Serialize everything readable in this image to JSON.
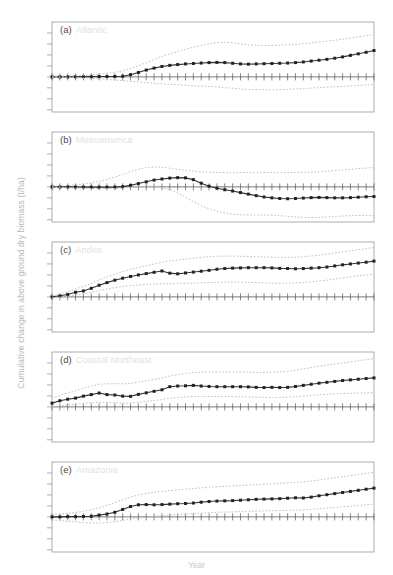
{
  "figure": {
    "ylabel": "Cumulative change in above ground dry biomass (t/ha)",
    "xlabel": "Year",
    "colors": {
      "line": "#333333",
      "marker": "#222222",
      "band": "#c0c0c8",
      "frame": "#9a9a9a",
      "zero_line": "#555555",
      "title_faint": "#e2e2e2",
      "axis_label": "#c2c2c2"
    }
  },
  "chart_data": [
    {
      "type": "line",
      "id": "a",
      "panel_label": "(a)",
      "title": "Atlantic",
      "xlabel": "",
      "ylabel": "",
      "xlim": [
        0,
        41
      ],
      "ylim": [
        -3.2,
        5.0
      ],
      "grid": false,
      "legend": "none",
      "x": [
        0,
        1,
        2,
        3,
        4,
        5,
        6,
        7,
        8,
        9,
        10,
        11,
        12,
        13,
        14,
        15,
        16,
        17,
        18,
        19,
        20,
        21,
        22,
        23,
        24,
        25,
        26,
        27,
        28,
        29,
        30,
        31,
        32,
        33,
        34,
        35,
        36,
        37,
        38,
        39,
        40,
        41
      ],
      "series": [
        {
          "name": "mean",
          "style": "solid-marker",
          "values": [
            0.0,
            0.0,
            0.0,
            0.01,
            0.02,
            0.02,
            0.03,
            0.03,
            0.04,
            0.06,
            0.2,
            0.4,
            0.62,
            0.8,
            0.95,
            1.05,
            1.12,
            1.18,
            1.22,
            1.26,
            1.3,
            1.32,
            1.3,
            1.24,
            1.18,
            1.16,
            1.18,
            1.2,
            1.22,
            1.24,
            1.26,
            1.3,
            1.36,
            1.44,
            1.52,
            1.6,
            1.7,
            1.82,
            1.96,
            2.1,
            2.24,
            2.4
          ]
        },
        {
          "name": "upper",
          "style": "dotted",
          "values": [
            0.05,
            0.06,
            0.08,
            0.1,
            0.14,
            0.18,
            0.24,
            0.32,
            0.42,
            0.56,
            0.78,
            1.02,
            1.3,
            1.58,
            1.86,
            2.1,
            2.32,
            2.52,
            2.7,
            2.86,
            3.0,
            3.12,
            3.16,
            3.1,
            3.0,
            2.92,
            2.88,
            2.86,
            2.86,
            2.88,
            2.92,
            2.96,
            3.02,
            3.1,
            3.18,
            3.26,
            3.34,
            3.44,
            3.54,
            3.64,
            3.74,
            3.86
          ]
        },
        {
          "name": "lower",
          "style": "dotted",
          "values": [
            -0.04,
            -0.05,
            -0.06,
            -0.08,
            -0.1,
            -0.13,
            -0.17,
            -0.22,
            -0.28,
            -0.34,
            -0.4,
            -0.46,
            -0.52,
            -0.58,
            -0.63,
            -0.68,
            -0.72,
            -0.76,
            -0.8,
            -0.84,
            -0.88,
            -0.92,
            -0.98,
            -1.04,
            -1.1,
            -1.14,
            -1.16,
            -1.18,
            -1.18,
            -1.16,
            -1.14,
            -1.1,
            -1.06,
            -1.02,
            -0.98,
            -0.94,
            -0.9,
            -0.86,
            -0.82,
            -0.78,
            -0.74,
            -0.7
          ]
        }
      ]
    },
    {
      "type": "line",
      "id": "b",
      "panel_label": "(b)",
      "title": "Mesoamerica",
      "xlabel": "",
      "ylabel": "",
      "xlim": [
        0,
        41
      ],
      "ylim": [
        -3.2,
        5.0
      ],
      "grid": false,
      "legend": "none",
      "x": [
        0,
        1,
        2,
        3,
        4,
        5,
        6,
        7,
        8,
        9,
        10,
        11,
        12,
        13,
        14,
        15,
        16,
        17,
        18,
        19,
        20,
        21,
        22,
        23,
        24,
        25,
        26,
        27,
        28,
        29,
        30,
        31,
        32,
        33,
        34,
        35,
        36,
        37,
        38,
        39,
        40,
        41
      ],
      "series": [
        {
          "name": "mean",
          "style": "solid-marker",
          "values": [
            0.0,
            0.0,
            0.0,
            -0.01,
            -0.02,
            -0.02,
            -0.03,
            -0.03,
            -0.02,
            0.02,
            0.14,
            0.3,
            0.46,
            0.62,
            0.72,
            0.8,
            0.84,
            0.82,
            0.66,
            0.34,
            0.06,
            -0.12,
            -0.26,
            -0.38,
            -0.52,
            -0.66,
            -0.8,
            -0.92,
            -1.0,
            -1.06,
            -1.08,
            -1.06,
            -1.02,
            -0.98,
            -0.96,
            -0.98,
            -1.0,
            -1.0,
            -0.98,
            -0.94,
            -0.9,
            -0.88
          ]
        },
        {
          "name": "upper",
          "style": "dotted",
          "values": [
            0.06,
            0.08,
            0.12,
            0.18,
            0.26,
            0.36,
            0.5,
            0.68,
            0.9,
            1.14,
            1.4,
            1.62,
            1.76,
            1.82,
            1.78,
            1.7,
            1.6,
            1.52,
            1.44,
            1.38,
            1.34,
            1.32,
            1.3,
            1.3,
            1.3,
            1.3,
            1.3,
            1.3,
            1.3,
            1.3,
            1.3,
            1.3,
            1.32,
            1.34,
            1.38,
            1.42,
            1.48,
            1.54,
            1.6,
            1.66,
            1.72,
            1.76
          ]
        },
        {
          "name": "lower",
          "style": "dotted",
          "values": [
            -0.05,
            -0.06,
            -0.08,
            -0.1,
            -0.12,
            -0.14,
            -0.16,
            -0.16,
            -0.14,
            -0.1,
            -0.04,
            0.02,
            0.06,
            0.04,
            -0.06,
            -0.26,
            -0.56,
            -0.94,
            -1.34,
            -1.7,
            -2.0,
            -2.22,
            -2.38,
            -2.48,
            -2.54,
            -2.56,
            -2.56,
            -2.56,
            -2.58,
            -2.62,
            -2.68,
            -2.74,
            -2.78,
            -2.8,
            -2.78,
            -2.74,
            -2.7,
            -2.66,
            -2.62,
            -2.6,
            -2.6,
            -2.62
          ]
        }
      ]
    },
    {
      "type": "line",
      "id": "c",
      "panel_label": "(c)",
      "title": "Andes",
      "xlabel": "",
      "ylabel": "",
      "xlim": [
        0,
        41
      ],
      "ylim": [
        -3.2,
        5.0
      ],
      "grid": false,
      "legend": "none",
      "x": [
        0,
        1,
        2,
        3,
        4,
        5,
        6,
        7,
        8,
        9,
        10,
        11,
        12,
        13,
        14,
        15,
        16,
        17,
        18,
        19,
        20,
        21,
        22,
        23,
        24,
        25,
        26,
        27,
        28,
        29,
        30,
        31,
        32,
        33,
        34,
        35,
        36,
        37,
        38,
        39,
        40,
        41
      ],
      "series": [
        {
          "name": "mean",
          "style": "solid-marker",
          "values": [
            0.0,
            0.1,
            0.22,
            0.42,
            0.54,
            0.78,
            1.06,
            1.3,
            1.52,
            1.7,
            1.86,
            2.0,
            2.12,
            2.24,
            2.36,
            2.16,
            2.1,
            2.18,
            2.26,
            2.34,
            2.42,
            2.52,
            2.58,
            2.62,
            2.64,
            2.66,
            2.66,
            2.66,
            2.64,
            2.6,
            2.58,
            2.56,
            2.58,
            2.62,
            2.66,
            2.72,
            2.82,
            2.92,
            3.0,
            3.08,
            3.16,
            3.26
          ]
        },
        {
          "name": "upper",
          "style": "dotted",
          "values": [
            0.1,
            0.26,
            0.46,
            0.72,
            0.94,
            1.22,
            1.54,
            1.82,
            2.08,
            2.3,
            2.5,
            2.68,
            2.84,
            3.0,
            3.16,
            3.28,
            3.36,
            3.44,
            3.52,
            3.6,
            3.66,
            3.7,
            3.72,
            3.72,
            3.7,
            3.68,
            3.66,
            3.64,
            3.62,
            3.6,
            3.6,
            3.62,
            3.66,
            3.72,
            3.8,
            3.9,
            4.0,
            4.1,
            4.2,
            4.3,
            4.4,
            4.5
          ]
        },
        {
          "name": "lower",
          "style": "dotted",
          "values": [
            -0.06,
            -0.02,
            0.06,
            0.18,
            0.28,
            0.42,
            0.58,
            0.72,
            0.84,
            0.94,
            1.02,
            1.08,
            1.12,
            1.16,
            1.18,
            1.2,
            1.22,
            1.24,
            1.26,
            1.28,
            1.3,
            1.32,
            1.34,
            1.34,
            1.34,
            1.32,
            1.3,
            1.28,
            1.26,
            1.24,
            1.24,
            1.26,
            1.3,
            1.36,
            1.44,
            1.52,
            1.62,
            1.72,
            1.82,
            1.92,
            2.0,
            2.08
          ]
        }
      ]
    },
    {
      "type": "line",
      "id": "d",
      "panel_label": "(d)",
      "title": "Coastal Northeast",
      "xlabel": "",
      "ylabel": "",
      "xlim": [
        0,
        41
      ],
      "ylim": [
        -3.2,
        5.0
      ],
      "grid": false,
      "legend": "none",
      "x": [
        0,
        1,
        2,
        3,
        4,
        5,
        6,
        7,
        8,
        9,
        10,
        11,
        12,
        13,
        14,
        15,
        16,
        17,
        18,
        19,
        20,
        21,
        22,
        23,
        24,
        25,
        26,
        27,
        28,
        29,
        30,
        31,
        32,
        33,
        34,
        35,
        36,
        37,
        38,
        39,
        40,
        41
      ],
      "series": [
        {
          "name": "mean",
          "style": "solid-marker",
          "values": [
            0.34,
            0.56,
            0.7,
            0.8,
            0.98,
            1.12,
            1.26,
            1.12,
            1.08,
            0.98,
            0.96,
            1.14,
            1.28,
            1.42,
            1.56,
            1.84,
            1.9,
            1.92,
            1.96,
            1.9,
            1.86,
            1.84,
            1.84,
            1.84,
            1.84,
            1.82,
            1.78,
            1.76,
            1.78,
            1.76,
            1.78,
            1.86,
            1.96,
            2.06,
            2.16,
            2.24,
            2.32,
            2.4,
            2.46,
            2.52,
            2.58,
            2.64
          ]
        },
        {
          "name": "upper",
          "style": "dotted",
          "values": [
            0.8,
            1.06,
            1.28,
            1.46,
            1.7,
            1.9,
            2.06,
            2.1,
            2.12,
            2.1,
            2.14,
            2.26,
            2.38,
            2.5,
            2.62,
            2.82,
            2.94,
            3.04,
            3.12,
            3.16,
            3.18,
            3.18,
            3.18,
            3.18,
            3.18,
            3.16,
            3.14,
            3.14,
            3.16,
            3.18,
            3.24,
            3.34,
            3.46,
            3.58,
            3.7,
            3.8,
            3.9,
            4.0,
            4.1,
            4.2,
            4.3,
            4.4
          ]
        },
        {
          "name": "lower",
          "style": "dotted",
          "values": [
            0.0,
            0.1,
            0.18,
            0.24,
            0.32,
            0.38,
            0.42,
            0.4,
            0.38,
            0.34,
            0.34,
            0.42,
            0.5,
            0.58,
            0.66,
            0.8,
            0.86,
            0.9,
            0.94,
            0.94,
            0.94,
            0.94,
            0.94,
            0.94,
            0.92,
            0.9,
            0.88,
            0.86,
            0.86,
            0.86,
            0.88,
            0.92,
            0.98,
            1.04,
            1.1,
            1.14,
            1.18,
            1.22,
            1.24,
            1.26,
            1.28,
            1.3
          ]
        }
      ]
    },
    {
      "type": "line",
      "id": "e",
      "panel_label": "(e)",
      "title": "Amazonia",
      "xlabel": "",
      "ylabel": "",
      "xlim": [
        0,
        41
      ],
      "ylim": [
        -3.2,
        5.0
      ],
      "grid": false,
      "legend": "none",
      "x": [
        0,
        1,
        2,
        3,
        4,
        5,
        6,
        7,
        8,
        9,
        10,
        11,
        12,
        13,
        14,
        15,
        16,
        17,
        18,
        19,
        20,
        21,
        22,
        23,
        24,
        25,
        26,
        27,
        28,
        29,
        30,
        31,
        32,
        33,
        34,
        35,
        36,
        37,
        38,
        39,
        40,
        41
      ],
      "series": [
        {
          "name": "mean",
          "style": "solid-marker",
          "values": [
            0.0,
            0.0,
            0.02,
            0.02,
            0.04,
            0.06,
            0.16,
            0.26,
            0.42,
            0.68,
            0.94,
            1.1,
            1.12,
            1.1,
            1.12,
            1.16,
            1.2,
            1.22,
            1.26,
            1.34,
            1.4,
            1.44,
            1.46,
            1.48,
            1.52,
            1.56,
            1.6,
            1.62,
            1.64,
            1.66,
            1.7,
            1.74,
            1.72,
            1.8,
            1.92,
            2.02,
            2.12,
            2.22,
            2.32,
            2.42,
            2.52,
            2.62
          ]
        },
        {
          "name": "upper",
          "style": "dotted",
          "values": [
            0.22,
            0.26,
            0.32,
            0.4,
            0.5,
            0.64,
            0.84,
            1.06,
            1.3,
            1.56,
            1.8,
            2.0,
            2.14,
            2.24,
            2.32,
            2.4,
            2.46,
            2.52,
            2.58,
            2.64,
            2.7,
            2.74,
            2.78,
            2.82,
            2.86,
            2.9,
            2.94,
            2.98,
            3.02,
            3.06,
            3.1,
            3.14,
            3.18,
            3.26,
            3.36,
            3.46,
            3.56,
            3.66,
            3.76,
            3.86,
            3.96,
            4.06
          ]
        },
        {
          "name": "lower",
          "style": "dotted",
          "values": [
            -0.28,
            -0.34,
            -0.4,
            -0.46,
            -0.52,
            -0.56,
            -0.56,
            -0.52,
            -0.44,
            -0.32,
            -0.2,
            -0.1,
            -0.02,
            0.04,
            0.1,
            0.16,
            0.22,
            0.26,
            0.3,
            0.34,
            0.38,
            0.42,
            0.44,
            0.46,
            0.48,
            0.5,
            0.52,
            0.54,
            0.56,
            0.58,
            0.6,
            0.62,
            0.64,
            0.68,
            0.74,
            0.8,
            0.86,
            0.92,
            0.98,
            1.04,
            1.1,
            1.16
          ]
        }
      ]
    }
  ]
}
